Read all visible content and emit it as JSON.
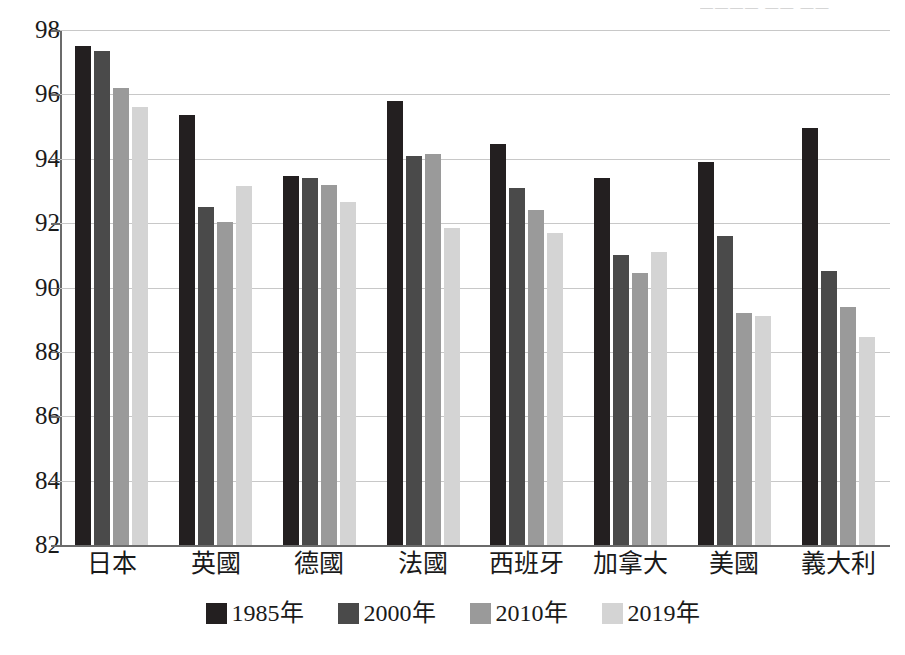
{
  "chart_data": {
    "type": "bar",
    "title": "",
    "subtitle": "",
    "xlabel": "",
    "ylabel": "",
    "ylim": [
      82,
      98
    ],
    "ytick_step": 2,
    "yticks": [
      "98",
      "96",
      "94",
      "92",
      "90",
      "88",
      "86",
      "84",
      "82"
    ],
    "grid": true,
    "legend_position": "bottom",
    "categories": [
      "日本",
      "英國",
      "德國",
      "法國",
      "西班牙",
      "加拿大",
      "美國",
      "義大利"
    ],
    "series": [
      {
        "name": "1985年",
        "color": "#231f20",
        "values": [
          97.5,
          95.35,
          93.45,
          95.8,
          94.45,
          93.4,
          93.9,
          94.95
        ]
      },
      {
        "name": "2000年",
        "color": "#4a4a4a",
        "values": [
          97.35,
          92.5,
          93.4,
          94.1,
          93.1,
          91.0,
          91.6,
          90.5
        ]
      },
      {
        "name": "2010年",
        "color": "#9a9a9a",
        "values": [
          96.2,
          92.05,
          93.2,
          94.15,
          92.4,
          90.45,
          89.2,
          89.4
        ]
      },
      {
        "name": "2019年",
        "color": "#d4d4d4",
        "values": [
          95.6,
          93.15,
          92.65,
          91.85,
          91.7,
          91.1,
          89.1,
          88.45
        ]
      }
    ]
  },
  "artifacts": {
    "top_clipped_text": "———— ——  ——"
  }
}
